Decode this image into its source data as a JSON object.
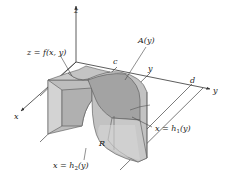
{
  "diagram": {
    "axes": {
      "z_label": "z",
      "y_label": "y",
      "x_label": "x"
    },
    "labels": {
      "surface": "z = f(x, y)",
      "area": "A(y)",
      "c": "c",
      "y_tick": "y",
      "d": "d",
      "region": "R",
      "h1_prefix": "x = h",
      "h1_sub": "1",
      "h1_suffix": "(y)",
      "h2_prefix": "x = h",
      "h2_sub": "2",
      "h2_suffix": "(y)"
    },
    "colors": {
      "solid_side": "#b9b9b9",
      "solid_dark": "#a6a6a6",
      "solid_light": "#cfcfcf",
      "cross_section": "#9e9e9e",
      "lines": "#333333",
      "background": "#ffffff"
    }
  }
}
